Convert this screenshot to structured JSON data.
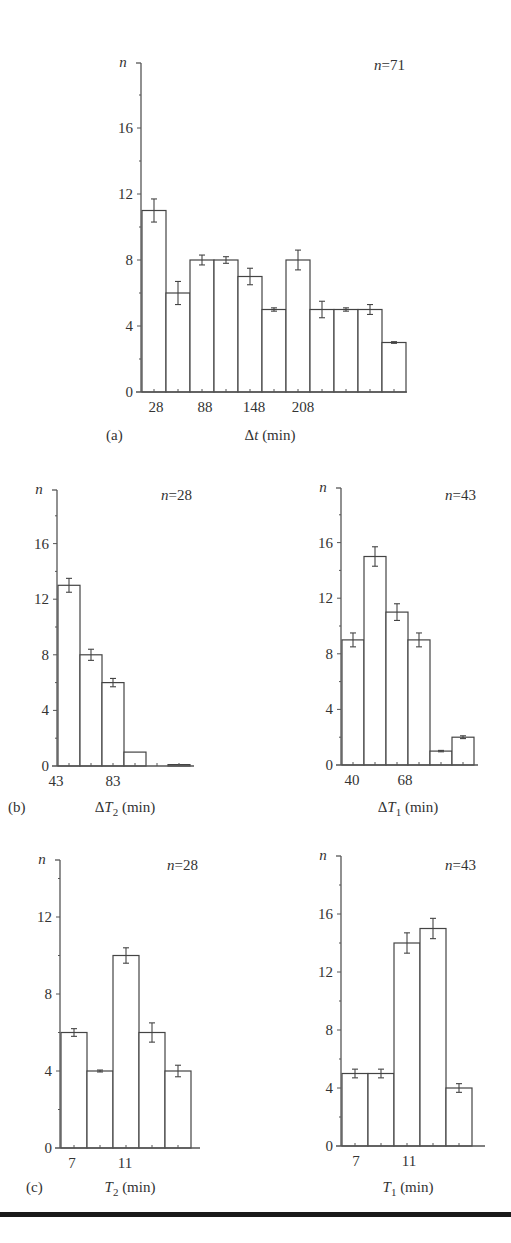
{
  "figure": {
    "panels": [
      {
        "id": "a",
        "panel_label": "(a)",
        "n_label": "n = 71",
        "ylabel": "n",
        "xlabel": "Δt (min)",
        "x_ticks": [
          "28",
          "88",
          "148",
          "208"
        ],
        "y_ticks": [
          "0",
          "4",
          "8",
          "12",
          "16"
        ]
      },
      {
        "id": "b-left",
        "panel_label": "(b)",
        "n_label": "n = 28",
        "ylabel": "n",
        "xlabel": "ΔT2 (min)",
        "x_ticks": [
          "43",
          "83"
        ],
        "y_ticks": [
          "0",
          "4",
          "8",
          "12",
          "16"
        ]
      },
      {
        "id": "b-right",
        "panel_label": "",
        "n_label": "n = 43",
        "ylabel": "n",
        "xlabel": "ΔT1 (min)",
        "x_ticks": [
          "40",
          "68"
        ],
        "y_ticks": [
          "0",
          "4",
          "8",
          "12",
          "16"
        ]
      },
      {
        "id": "c-left",
        "panel_label": "(c)",
        "n_label": "n = 28",
        "ylabel": "n",
        "xlabel": "T2 (min)",
        "x_ticks": [
          "7",
          "11"
        ],
        "y_ticks": [
          "0",
          "4",
          "8",
          "12"
        ]
      },
      {
        "id": "c-right",
        "panel_label": "",
        "n_label": "n = 43",
        "ylabel": "n",
        "xlabel": "T1 (min)",
        "x_ticks": [
          "7",
          "11"
        ],
        "y_ticks": [
          "0",
          "4",
          "8",
          "12",
          "16"
        ]
      }
    ]
  },
  "chart_data": [
    {
      "type": "bar",
      "panel": "(a)",
      "title": "n = 71",
      "xlabel": "Δt (min)",
      "ylabel": "n",
      "x_tick_labels": [
        "28",
        "88",
        "148",
        "208"
      ],
      "bin_width": 30,
      "bin_starts": [
        13,
        43,
        73,
        103,
        133,
        163,
        193,
        223,
        253,
        283,
        313
      ],
      "values": [
        11,
        6,
        8,
        8,
        7,
        5,
        8,
        5,
        5,
        5,
        3
      ],
      "error": [
        0.7,
        0.7,
        0.3,
        0.2,
        0.5,
        0.1,
        0.6,
        0.5,
        0.1,
        0.3,
        0.05
      ],
      "ylim": [
        0,
        20
      ],
      "yticks": [
        0,
        4,
        8,
        12,
        16
      ],
      "grid": false,
      "legend": null
    },
    {
      "type": "bar",
      "panel": "(b) left",
      "title": "n = 28",
      "xlabel": "ΔT2 (min)",
      "ylabel": "n",
      "x_tick_labels": [
        "43",
        "83"
      ],
      "values": [
        13,
        8,
        6,
        1,
        0,
        0.1
      ],
      "error": [
        0.5,
        0.4,
        0.3,
        0,
        0,
        0
      ],
      "ylim": [
        0,
        20
      ],
      "yticks": [
        0,
        4,
        8,
        12,
        16
      ],
      "grid": false
    },
    {
      "type": "bar",
      "panel": "(b) right",
      "title": "n = 43",
      "xlabel": "ΔT1 (min)",
      "ylabel": "n",
      "x_tick_labels": [
        "40",
        "68"
      ],
      "values": [
        9,
        15,
        11,
        9,
        1,
        2
      ],
      "error": [
        0.5,
        0.7,
        0.6,
        0.5,
        0.05,
        0.1
      ],
      "ylim": [
        0,
        20
      ],
      "yticks": [
        0,
        4,
        8,
        12,
        16
      ],
      "grid": false
    },
    {
      "type": "bar",
      "panel": "(c) left",
      "title": "n = 28",
      "xlabel": "T2 (min)",
      "ylabel": "n",
      "x_tick_labels": [
        "7",
        "11"
      ],
      "values": [
        6,
        4,
        10,
        6,
        4
      ],
      "error": [
        0.2,
        0.05,
        0.4,
        0.5,
        0.3
      ],
      "ylim": [
        0,
        15
      ],
      "yticks": [
        0,
        4,
        8,
        12
      ],
      "grid": false
    },
    {
      "type": "bar",
      "panel": "(c) right",
      "title": "n = 43",
      "xlabel": "T1 (min)",
      "ylabel": "n",
      "x_tick_labels": [
        "7",
        "11"
      ],
      "values": [
        5,
        5,
        14,
        15,
        4
      ],
      "error": [
        0.3,
        0.3,
        0.7,
        0.7,
        0.3
      ],
      "ylim": [
        0,
        20
      ],
      "yticks": [
        0,
        4,
        8,
        12,
        16
      ],
      "grid": false
    }
  ]
}
